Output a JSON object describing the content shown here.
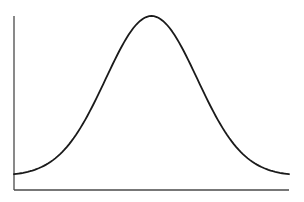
{
  "chart_data": {
    "type": "line",
    "title": "",
    "xlabel": "",
    "ylabel": "",
    "grid": false,
    "legend": null,
    "x": [
      -3.0,
      -2.5,
      -2.0,
      -1.5,
      -1.0,
      -0.5,
      0.0,
      0.5,
      1.0,
      1.5,
      2.0,
      2.5,
      3.0
    ],
    "series": [
      {
        "name": "bell curve",
        "values": [
          0.011,
          0.044,
          0.135,
          0.325,
          0.607,
          0.882,
          1.0,
          0.882,
          0.607,
          0.325,
          0.135,
          0.044,
          0.011
        ]
      }
    ],
    "xlim": [
      -3.0,
      3.0
    ],
    "ylim": [
      0,
      1.0
    ],
    "colors": {
      "curve": "#1a1a1a",
      "axis": "#4a4a4a",
      "background": "#ffffff"
    }
  },
  "layout": {
    "plot": {
      "x0": 14,
      "x1": 289,
      "y_top": 16,
      "y_baseline": 176,
      "y_axis_bottom": 190
    }
  }
}
